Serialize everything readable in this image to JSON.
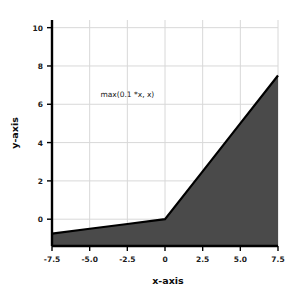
{
  "chart_data": {
    "type": "area",
    "title": "",
    "xlabel": "x-axis",
    "ylabel": "y-axis",
    "xlim": [
      -7.5,
      7.5
    ],
    "ylim": [
      -1.4,
      10.4
    ],
    "grid": true,
    "legend": null,
    "series": [
      {
        "name": "max(0.1 *x, x)",
        "x": [
          -7.5,
          -5.0,
          -2.5,
          0,
          2.5,
          5.0,
          7.5
        ],
        "values": [
          -0.75,
          -0.5,
          -0.25,
          0,
          2.5,
          5.0,
          7.5
        ],
        "line_color": "#000000",
        "fill_color": "#4a4a4a",
        "fill_to": "bottom"
      }
    ],
    "annotations": [
      {
        "text": "max(0.1 *x, x)",
        "x": -2.5,
        "y": 6.4
      }
    ],
    "xticks": [
      -7.5,
      -5.0,
      -2.5,
      0,
      2.5,
      5.0,
      7.5
    ],
    "xticklabels": [
      "-7.5",
      "-5.0",
      "-2.5",
      "0",
      "2.5",
      "5.0",
      "7.5"
    ],
    "yticks": [
      0,
      2,
      4,
      6,
      8,
      10
    ],
    "yticklabels": [
      "0",
      "2",
      "4",
      "6",
      "8",
      "10"
    ],
    "colors": {
      "background": "#ffffff",
      "grid": "#d8d8d8",
      "spine": "#000000",
      "fill": "#4a4a4a",
      "line": "#000000",
      "text": "#1a1a1a"
    }
  }
}
